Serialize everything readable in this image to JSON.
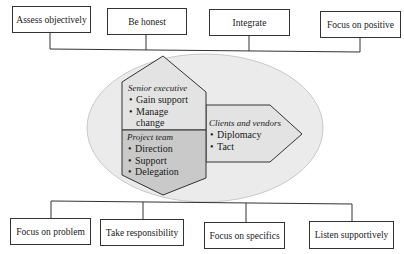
{
  "top_boxes": [
    {
      "label": "Assess objectively"
    },
    {
      "label": "Be honest"
    },
    {
      "label": "Integrate"
    },
    {
      "label": "Focus on positive"
    }
  ],
  "bottom_boxes": [
    {
      "label": "Focus on problem"
    },
    {
      "label": "Take responsibility"
    },
    {
      "label": "Focus on specifics"
    },
    {
      "label": "Listen supportively"
    }
  ],
  "center": {
    "senior_executive": {
      "title": "Senior executive",
      "items": [
        "Gain support",
        "Manage change"
      ]
    },
    "project_team": {
      "title": "Project team",
      "items": [
        "Direction",
        "Support",
        "Delegation"
      ]
    },
    "clients_vendors": {
      "title": "Clients and vendors",
      "items": [
        "Diplomacy",
        "Tact"
      ]
    }
  },
  "colors": {
    "ellipse": "#ebebeb",
    "upper_hex": "#e3e3e3",
    "lower_hex": "#c9c9c9",
    "arrow": "#e3e3e3",
    "line": "#333333"
  }
}
